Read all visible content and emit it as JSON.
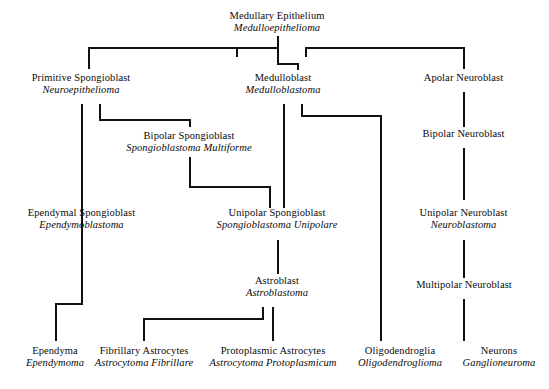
{
  "diagram": {
    "line_color": "#111111",
    "background": "#ffffff",
    "nodes": [
      {
        "id": "medullary-epithelium",
        "name": "Medullary Epithelium",
        "latin": "Medulloepithelioma"
      },
      {
        "id": "primitive-spongioblast",
        "name": "Primitive Spongioblast",
        "latin": "Neuroepithelioma"
      },
      {
        "id": "medulloblast",
        "name": "Medulloblast",
        "latin": "Medulloblastoma"
      },
      {
        "id": "apolar-neuroblast",
        "name": "Apolar Neuroblast",
        "latin": ""
      },
      {
        "id": "bipolar-spongioblast",
        "name": "Bipolar Spongioblast",
        "latin": "Spongioblastoma Multiforme"
      },
      {
        "id": "bipolar-neuroblast",
        "name": "Bipolar Neuroblast",
        "latin": ""
      },
      {
        "id": "ependymal-spongioblast",
        "name": "Ependymal Spongioblast",
        "latin": "Ependymoblastoma"
      },
      {
        "id": "unipolar-spongioblast",
        "name": "Unipolar Spongioblast",
        "latin": "Spongioblastoma Unipolare"
      },
      {
        "id": "unipolar-neuroblast",
        "name": "Unipolar Neuroblast",
        "latin": "Neuroblastoma"
      },
      {
        "id": "astroblast",
        "name": "Astroblast",
        "latin": "Astroblastoma"
      },
      {
        "id": "multipolar-neuroblast",
        "name": "Multipolar Neuroblast",
        "latin": ""
      },
      {
        "id": "ependyma",
        "name": "Ependyma",
        "latin": "Ependymoma"
      },
      {
        "id": "fibrillary-astrocytes",
        "name": "Fibrillary Astrocytes",
        "latin": "Astrocytoma Fibrillare"
      },
      {
        "id": "protoplasmic-astrocytes",
        "name": "Protoplasmic Astrocytes",
        "latin": "Astrocytoma Protoplasmicum"
      },
      {
        "id": "oligodendroglia",
        "name": "Oligodendroglia",
        "latin": "Oligodendroglioma"
      },
      {
        "id": "neurons",
        "name": "Neurons",
        "latin": "Ganglioneuroma"
      }
    ]
  }
}
